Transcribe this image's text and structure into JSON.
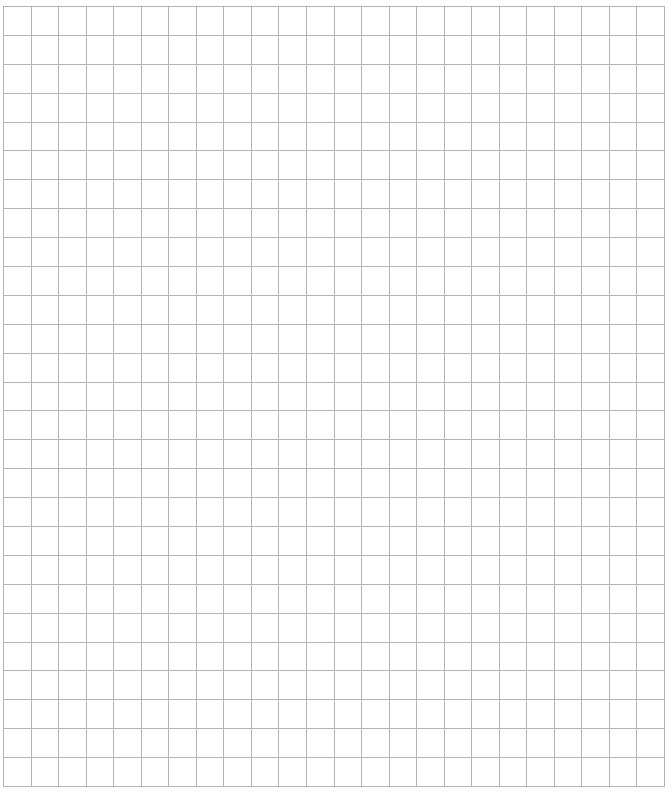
{
  "grid": {
    "columns": 24,
    "rows": 27,
    "left": 3,
    "top": 6,
    "width": 662,
    "height": 781,
    "line_color": "#b4b4b4",
    "background": "#ffffff"
  }
}
